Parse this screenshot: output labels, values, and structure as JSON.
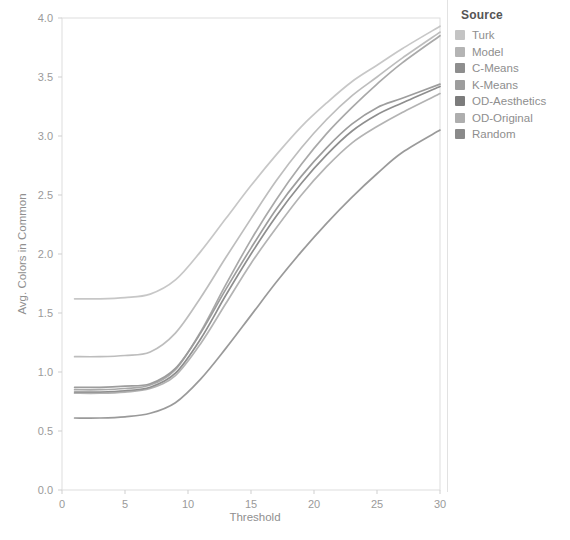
{
  "chart_data": {
    "type": "line",
    "title": "",
    "xlabel": "Threshold",
    "ylabel": "Avg. Colors in Common",
    "xlim": [
      0,
      30
    ],
    "ylim": [
      0,
      4.0
    ],
    "xticks": [
      "0",
      "5",
      "10",
      "15",
      "20",
      "25",
      "30"
    ],
    "xtick_values": [
      0,
      5,
      10,
      15,
      20,
      25,
      30
    ],
    "yticks": [
      "0.0",
      "0.5",
      "1.0",
      "1.5",
      "2.0",
      "2.5",
      "3.0",
      "3.5",
      "4.0"
    ],
    "ytick_values": [
      0.0,
      0.5,
      1.0,
      1.5,
      2.0,
      2.5,
      3.0,
      3.5,
      4.0
    ],
    "grid": false,
    "legend_position": "right",
    "legend_title": "Source",
    "x": [
      1,
      3,
      5,
      7,
      9,
      11,
      13,
      15,
      17,
      19,
      21,
      23,
      25,
      27,
      30
    ],
    "series": [
      {
        "name": "Turk",
        "color": "#bdbdbd",
        "values": [
          1.62,
          1.62,
          1.63,
          1.66,
          1.78,
          2.02,
          2.3,
          2.58,
          2.84,
          3.08,
          3.28,
          3.46,
          3.6,
          3.74,
          3.93
        ]
      },
      {
        "name": "Model",
        "color": "#b2b2b2",
        "values": [
          1.13,
          1.13,
          1.14,
          1.17,
          1.33,
          1.63,
          1.97,
          2.3,
          2.62,
          2.9,
          3.14,
          3.34,
          3.5,
          3.66,
          3.88
        ]
      },
      {
        "name": "C-Means",
        "color": "#8c8c8c",
        "values": [
          0.87,
          0.87,
          0.88,
          0.9,
          1.03,
          1.33,
          1.7,
          2.05,
          2.38,
          2.66,
          2.9,
          3.1,
          3.24,
          3.32,
          3.44
        ]
      },
      {
        "name": "K-Means",
        "color": "#9a9a9a",
        "values": [
          0.85,
          0.85,
          0.86,
          0.89,
          1.02,
          1.34,
          1.74,
          2.12,
          2.46,
          2.76,
          3.02,
          3.24,
          3.44,
          3.62,
          3.85
        ]
      },
      {
        "name": "OD-Aesthetics",
        "color": "#7a7a7a",
        "values": [
          0.83,
          0.83,
          0.84,
          0.87,
          0.99,
          1.28,
          1.65,
          2.0,
          2.32,
          2.6,
          2.84,
          3.04,
          3.18,
          3.28,
          3.42
        ]
      },
      {
        "name": "OD-Original",
        "color": "#a6a6a6",
        "values": [
          0.82,
          0.82,
          0.83,
          0.86,
          0.97,
          1.24,
          1.58,
          1.92,
          2.22,
          2.5,
          2.74,
          2.94,
          3.08,
          3.2,
          3.36
        ]
      },
      {
        "name": "Random",
        "color": "#888888",
        "values": [
          0.61,
          0.61,
          0.62,
          0.65,
          0.74,
          0.94,
          1.2,
          1.48,
          1.76,
          2.02,
          2.26,
          2.48,
          2.68,
          2.86,
          3.05
        ]
      }
    ]
  },
  "legend": {
    "title": "Source",
    "items": [
      {
        "label": "Turk",
        "color": "#c4c4c4"
      },
      {
        "label": "Model",
        "color": "#b4b4b4"
      },
      {
        "label": "C-Means",
        "color": "#8e8e8e"
      },
      {
        "label": "K-Means",
        "color": "#9d9d9d"
      },
      {
        "label": "OD-Aesthetics",
        "color": "#7c7c7c"
      },
      {
        "label": "OD-Original",
        "color": "#aeaeae"
      },
      {
        "label": "Random",
        "color": "#8a8a8a"
      }
    ]
  },
  "axes": {
    "x_title": "Threshold",
    "y_title": "Avg. Colors in Common"
  }
}
